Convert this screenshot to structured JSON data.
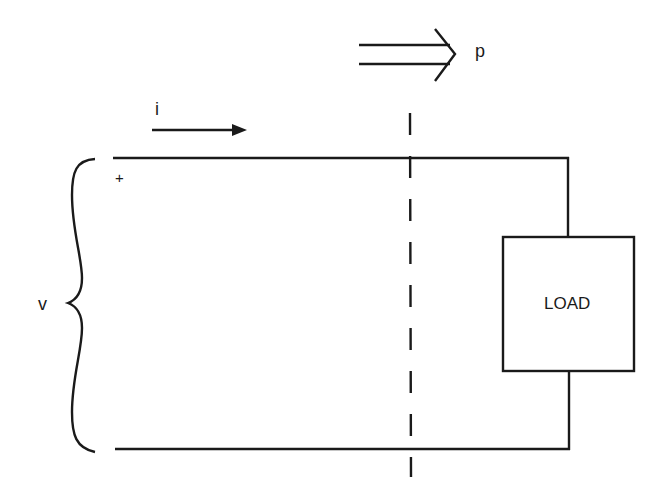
{
  "diagram": {
    "type": "circuit-power-flow",
    "labels": {
      "power": "p",
      "current": "i",
      "voltage": "v",
      "polarity_plus": "+",
      "load": "LOAD"
    },
    "colors": {
      "line": "#1a1a1a",
      "background": "#ffffff"
    }
  }
}
